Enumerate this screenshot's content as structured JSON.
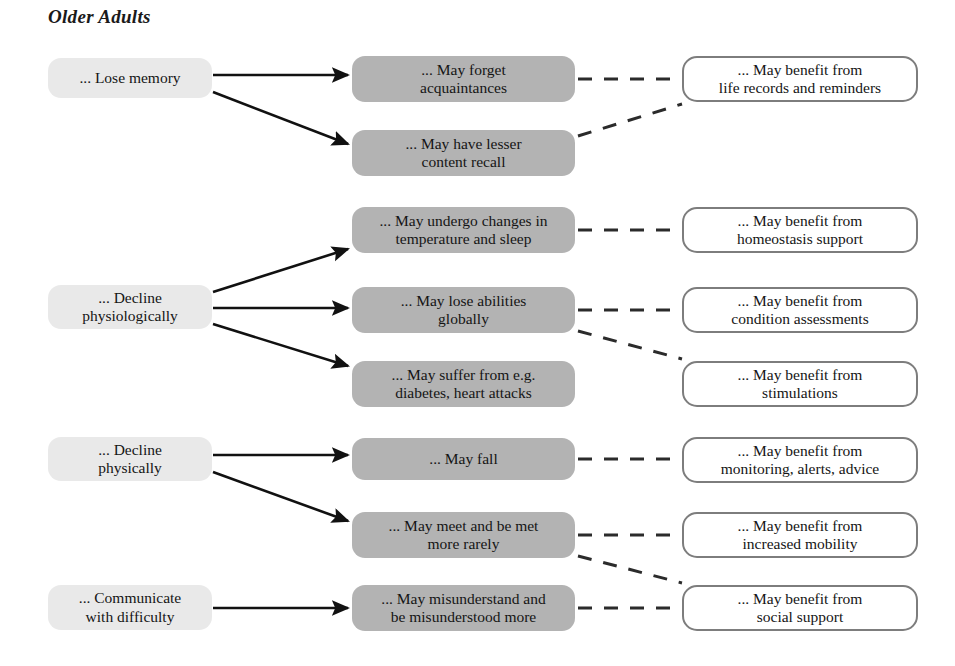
{
  "diagram": {
    "title": "Older Adults",
    "canvas": {
      "width": 955,
      "height": 666
    },
    "colors": {
      "cause_fill": "#e9e9e9",
      "effect_fill": "#b3b3b3",
      "benefit_fill": "#ffffff",
      "benefit_border": "#7d7d7d",
      "arrow": "#111111",
      "dashed": "#2b2b2b",
      "text": "#151515"
    },
    "columns": [
      {
        "key": "causes",
        "label": "Causes"
      },
      {
        "key": "effects",
        "label": "Effects"
      },
      {
        "key": "benefits",
        "label": "Benefits"
      }
    ],
    "nodes": {
      "causes": [
        {
          "id": "c1",
          "text": "... Lose memory",
          "x": 48,
          "y": 58,
          "w": 164,
          "h": 40
        },
        {
          "id": "c2",
          "text": "... Decline\nphysiologically",
          "x": 48,
          "y": 285,
          "w": 164,
          "h": 44
        },
        {
          "id": "c3",
          "text": "... Decline\nphysically",
          "x": 48,
          "y": 437,
          "w": 164,
          "h": 44
        },
        {
          "id": "c4",
          "text": "... Communicate\nwith difficulty",
          "x": 48,
          "y": 585,
          "w": 164,
          "h": 45
        }
      ],
      "effects": [
        {
          "id": "e1",
          "text": "... May forget\nacquaintances",
          "x": 352,
          "y": 56,
          "w": 223,
          "h": 46
        },
        {
          "id": "e2",
          "text": "... May have lesser\ncontent recall",
          "x": 352,
          "y": 130,
          "w": 223,
          "h": 46
        },
        {
          "id": "e3",
          "text": "... May undergo changes in\ntemperature and sleep",
          "x": 352,
          "y": 207,
          "w": 223,
          "h": 46
        },
        {
          "id": "e4",
          "text": "... May lose abilities\nglobally",
          "x": 352,
          "y": 287,
          "w": 223,
          "h": 46
        },
        {
          "id": "e5",
          "text": "... May suffer from e.g.\ndiabetes, heart attacks",
          "x": 352,
          "y": 361,
          "w": 223,
          "h": 46
        },
        {
          "id": "e6",
          "text": "... May fall",
          "x": 352,
          "y": 438,
          "w": 223,
          "h": 42
        },
        {
          "id": "e7",
          "text": "... May meet and be met\nmore rarely",
          "x": 352,
          "y": 512,
          "w": 223,
          "h": 46
        },
        {
          "id": "e8",
          "text": "... May misunderstand and\nbe misunderstood more",
          "x": 352,
          "y": 585,
          "w": 223,
          "h": 46
        }
      ],
      "benefits": [
        {
          "id": "b1",
          "text": "... May benefit from\nlife records and reminders",
          "x": 682,
          "y": 56,
          "w": 236,
          "h": 46
        },
        {
          "id": "b2",
          "text": "... May benefit from\nhomeostasis support",
          "x": 682,
          "y": 207,
          "w": 236,
          "h": 46
        },
        {
          "id": "b3",
          "text": "... May benefit from\ncondition assessments",
          "x": 682,
          "y": 287,
          "w": 236,
          "h": 46
        },
        {
          "id": "b4",
          "text": "... May benefit from\nstimulations",
          "x": 682,
          "y": 361,
          "w": 236,
          "h": 46
        },
        {
          "id": "b5",
          "text": "... May benefit from\nmonitoring, alerts, advice",
          "x": 682,
          "y": 437,
          "w": 236,
          "h": 46
        },
        {
          "id": "b6",
          "text": "... May benefit from\nincreased mobility",
          "x": 682,
          "y": 512,
          "w": 236,
          "h": 46
        },
        {
          "id": "b7",
          "text": "... May benefit from\nsocial support",
          "x": 682,
          "y": 585,
          "w": 236,
          "h": 46
        }
      ]
    },
    "arrows": [
      {
        "from": "c1",
        "to": "e1",
        "x1": 213,
        "y1": 75,
        "x2": 348,
        "y2": 75
      },
      {
        "from": "c1",
        "to": "e2",
        "x1": 213,
        "y1": 92,
        "x2": 348,
        "y2": 144
      },
      {
        "from": "c2",
        "to": "e3",
        "x1": 213,
        "y1": 292,
        "x2": 348,
        "y2": 249
      },
      {
        "from": "c2",
        "to": "e4",
        "x1": 213,
        "y1": 308,
        "x2": 348,
        "y2": 308
      },
      {
        "from": "c2",
        "to": "e5",
        "x1": 213,
        "y1": 324,
        "x2": 348,
        "y2": 366
      },
      {
        "from": "c3",
        "to": "e6",
        "x1": 213,
        "y1": 455,
        "x2": 348,
        "y2": 455
      },
      {
        "from": "c3",
        "to": "e7",
        "x1": 213,
        "y1": 472,
        "x2": 348,
        "y2": 521
      },
      {
        "from": "c4",
        "to": "e8",
        "x1": 213,
        "y1": 608,
        "x2": 348,
        "y2": 608
      }
    ],
    "dashed_links": [
      {
        "from": "e1",
        "to": "b1",
        "x1": 578,
        "y1": 79,
        "x2": 680,
        "y2": 79
      },
      {
        "from": "e2",
        "to": "b1",
        "x1": 578,
        "y1": 136,
        "x2": 682,
        "y2": 104
      },
      {
        "from": "e3",
        "to": "b2",
        "x1": 578,
        "y1": 230,
        "x2": 680,
        "y2": 230
      },
      {
        "from": "e4",
        "to": "b3",
        "x1": 578,
        "y1": 310,
        "x2": 680,
        "y2": 310
      },
      {
        "from": "e4",
        "to": "b4",
        "x1": 578,
        "y1": 331,
        "x2": 682,
        "y2": 359
      },
      {
        "from": "e6",
        "to": "b5",
        "x1": 578,
        "y1": 459,
        "x2": 680,
        "y2": 459
      },
      {
        "from": "e7",
        "to": "b6",
        "x1": 578,
        "y1": 535,
        "x2": 680,
        "y2": 535
      },
      {
        "from": "e7",
        "to": "b7",
        "x1": 578,
        "y1": 556,
        "x2": 682,
        "y2": 583
      },
      {
        "from": "e8",
        "to": "b7",
        "x1": 578,
        "y1": 608,
        "x2": 680,
        "y2": 608
      }
    ]
  }
}
